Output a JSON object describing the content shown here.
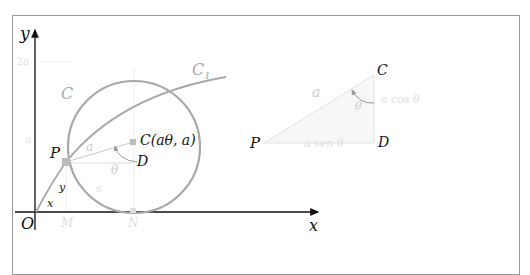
{
  "figure": {
    "axes": {
      "x_label": "x",
      "y_label": "y",
      "origin_label": "O",
      "y_tick_2a": "2a",
      "y_tick_a": "a"
    },
    "main": {
      "circle_label": "C",
      "curve_label": "C",
      "curve_subscript": "1",
      "point_P": "P",
      "center_label": "C(aθ, a)",
      "point_D": "D",
      "radius_label": "a",
      "angle_label": "θ",
      "arc_label": "s",
      "seg_x": "x",
      "seg_y": "y",
      "foot_M": "M",
      "foot_N": "N"
    },
    "triangle": {
      "vertex_C": "C",
      "vertex_P": "P",
      "vertex_D": "D",
      "hyp_label": "a",
      "angle_label": "θ",
      "vertical_label": "a cos θ",
      "horizontal_label": "a sen θ"
    },
    "colors": {
      "circle": "#a8a8a8",
      "faint": "#d8d8d8",
      "axis": "#111111",
      "triangle_fill": "#f7f7f7"
    }
  }
}
